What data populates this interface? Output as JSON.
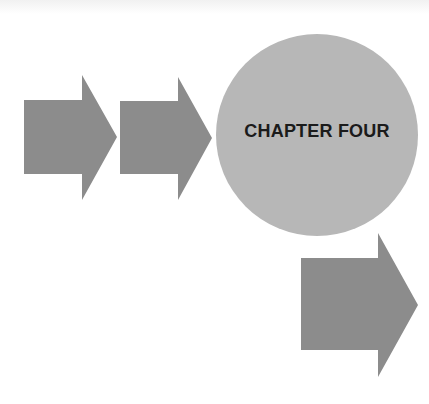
{
  "page": {
    "chapter_title": "CHAPTER FOUR"
  },
  "colors": {
    "background": "#ffffff",
    "arrow": "#8c8c8c",
    "circle": "#b7b7b7",
    "title_text": "#1b1b1b"
  },
  "shapes": {
    "arrows": [
      {
        "name": "arrow-1",
        "direction": "right"
      },
      {
        "name": "arrow-2",
        "direction": "right"
      },
      {
        "name": "arrow-3",
        "direction": "right"
      }
    ],
    "circle": {
      "name": "chapter-circle"
    }
  }
}
